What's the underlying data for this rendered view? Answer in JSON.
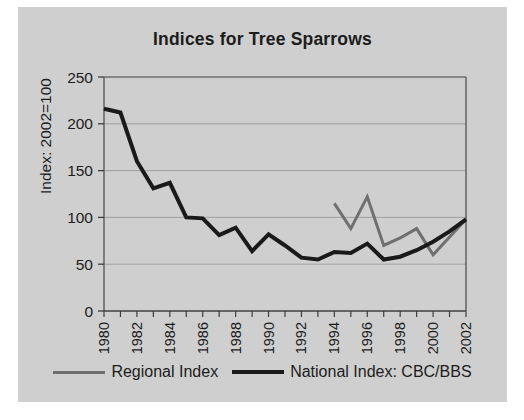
{
  "figure": {
    "background_color": "#cfcfcf",
    "page_background": "#ffffff"
  },
  "title": "Indices for Tree Sparrows",
  "axes": {
    "ylabel": "Index: 2002=100",
    "xlabel": "",
    "ytick_labels": [
      "0",
      "50",
      "100",
      "150",
      "200",
      "250"
    ],
    "xtick_labels": [
      "1980",
      "1982",
      "1984",
      "1986",
      "1988",
      "1990",
      "1992",
      "1994",
      "1996",
      "1998",
      "2000",
      "2002"
    ]
  },
  "legend": {
    "position": "bottom-center",
    "entries": [
      {
        "label": "Regional Index",
        "color": "#6f6f6f"
      },
      {
        "label": "National Index: CBC/BBS",
        "color": "#1a1a1a"
      }
    ]
  },
  "chart_data": {
    "type": "line",
    "title": "Indices for Tree Sparrows",
    "xlabel": "",
    "ylabel": "Index: 2002=100",
    "xlim": [
      1980,
      2002
    ],
    "ylim": [
      0,
      250
    ],
    "yticks": [
      0,
      50,
      100,
      150,
      200,
      250
    ],
    "xticks": [
      1980,
      1981,
      1982,
      1983,
      1984,
      1985,
      1986,
      1987,
      1988,
      1989,
      1990,
      1991,
      1992,
      1993,
      1994,
      1995,
      1996,
      1997,
      1998,
      1999,
      2000,
      2001,
      2002
    ],
    "xtick_labels_shown": [
      1980,
      1982,
      1984,
      1986,
      1988,
      1990,
      1992,
      1994,
      1996,
      1998,
      2000,
      2002
    ],
    "grid": true,
    "grid_axis": "y",
    "legend_position": "bottom-center",
    "series": [
      {
        "name": "National Index: CBC/BBS",
        "color": "#1a1a1a",
        "linewidth": 4,
        "x": [
          1980,
          1981,
          1982,
          1983,
          1984,
          1985,
          1986,
          1987,
          1988,
          1989,
          1990,
          1991,
          1992,
          1993,
          1994,
          1995,
          1996,
          1997,
          1998,
          1999,
          2000,
          2001,
          2002
        ],
        "values": [
          216,
          212,
          160,
          131,
          137,
          100,
          99,
          81,
          89,
          64,
          82,
          70,
          57,
          55,
          63,
          62,
          72,
          55,
          58,
          65,
          74,
          85,
          98
        ]
      },
      {
        "name": "Regional Index",
        "color": "#6f6f6f",
        "linewidth": 3,
        "x": [
          1994,
          1995,
          1996,
          1997,
          1998,
          1999,
          2000,
          2001,
          2002
        ],
        "values": [
          115,
          88,
          122,
          70,
          78,
          88,
          60,
          79,
          98
        ]
      }
    ]
  }
}
